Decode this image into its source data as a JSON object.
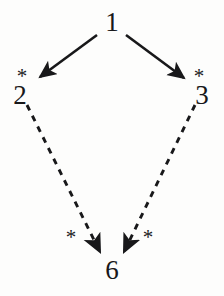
{
  "figure": {
    "kind": "directed-graph",
    "background_color": "#fdfdfc",
    "ink_color": "#18181a",
    "width": 224,
    "height": 296
  },
  "nodes": [
    {
      "id": "n1",
      "label": "1",
      "x": 112,
      "y": 22
    },
    {
      "id": "n2",
      "label": "2",
      "x": 20,
      "y": 95
    },
    {
      "id": "n3",
      "label": "3",
      "x": 202,
      "y": 95
    },
    {
      "id": "n6",
      "label": "6",
      "x": 112,
      "y": 270
    }
  ],
  "edges": [
    {
      "id": "e1",
      "from": "1",
      "to": "2",
      "style": "solid",
      "x1": 97,
      "y1": 35,
      "x2": 40,
      "y2": 77,
      "label": "*",
      "label_x": 22,
      "label_y": 76
    },
    {
      "id": "e2",
      "from": "1",
      "to": "3",
      "style": "solid",
      "x1": 126,
      "y1": 35,
      "x2": 184,
      "y2": 78,
      "label": "*",
      "label_x": 199,
      "label_y": 76
    },
    {
      "id": "e3",
      "from": "2",
      "to": "6",
      "style": "dashed",
      "x1": 27,
      "y1": 105,
      "x2": 100,
      "y2": 252,
      "label": "*",
      "label_x": 71,
      "label_y": 237
    },
    {
      "id": "e4",
      "from": "3",
      "to": "6",
      "style": "dashed",
      "x1": 195,
      "y1": 105,
      "x2": 124,
      "y2": 252,
      "label": "*",
      "label_x": 148,
      "label_y": 237
    }
  ]
}
